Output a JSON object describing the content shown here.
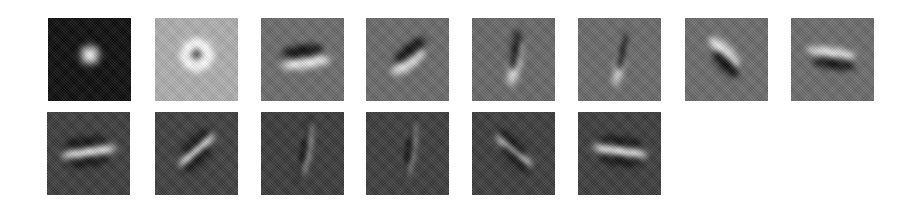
{
  "figure": {
    "rows": 2,
    "tile_size_px": 83,
    "tiles": [
      {
        "row": 0,
        "col": 0,
        "x": 48,
        "y": 18,
        "bg": "#0c0c0c",
        "kind": "center-on",
        "angle": 0,
        "blobs": [
          {
            "dx": 0,
            "dy": -2,
            "w": 14,
            "h": 14,
            "c": "#f2f2f2"
          },
          {
            "dx": 0,
            "dy": -2,
            "w": 22,
            "h": 22,
            "c": "#6a6a6a"
          }
        ]
      },
      {
        "row": 0,
        "col": 1,
        "x": 155,
        "y": 18,
        "bg": "#b0b0b0",
        "kind": "center-off",
        "angle": 0,
        "blobs": [
          {
            "dx": 0,
            "dy": -2,
            "w": 34,
            "h": 34,
            "c": "#ffffff"
          },
          {
            "dx": 0,
            "dy": -2,
            "w": 9,
            "h": 9,
            "c": "#050505"
          }
        ]
      },
      {
        "row": 0,
        "col": 2,
        "x": 261,
        "y": 18,
        "bg": "#6c6c6c",
        "kind": "oriented",
        "angle": 8,
        "blobs": [
          {
            "dx": 0,
            "dy": -6,
            "w": 42,
            "h": 12,
            "c": "#0a0a0a"
          },
          {
            "dx": 2,
            "dy": 6,
            "w": 50,
            "h": 12,
            "c": "#f0f0f0"
          }
        ]
      },
      {
        "row": 0,
        "col": 3,
        "x": 366,
        "y": 18,
        "bg": "#6a6a6a",
        "kind": "oriented",
        "angle": 38,
        "blobs": [
          {
            "dx": 5,
            "dy": -4,
            "w": 40,
            "h": 12,
            "c": "#0a0a0a"
          },
          {
            "dx": -3,
            "dy": 4,
            "w": 40,
            "h": 14,
            "c": "#f0f0f0"
          }
        ]
      },
      {
        "row": 0,
        "col": 4,
        "x": 472,
        "y": 18,
        "bg": "#686868",
        "kind": "oriented",
        "angle": 80,
        "blobs": [
          {
            "dx": -6,
            "dy": 2,
            "w": 48,
            "h": 12,
            "c": "#ececec"
          },
          {
            "dx": 6,
            "dy": 0,
            "w": 42,
            "h": 10,
            "c": "#0a0a0a"
          }
        ]
      },
      {
        "row": 0,
        "col": 5,
        "x": 578,
        "y": 18,
        "bg": "#6a6a6a",
        "kind": "oriented",
        "angle": 78,
        "blobs": [
          {
            "dx": -3,
            "dy": 2,
            "w": 56,
            "h": 9,
            "c": "#f0f0f0"
          },
          {
            "dx": 6,
            "dy": 2,
            "w": 42,
            "h": 9,
            "c": "#0a0a0a"
          }
        ]
      },
      {
        "row": 0,
        "col": 6,
        "x": 685,
        "y": 18,
        "bg": "#6c6c6c",
        "kind": "oriented",
        "angle": -45,
        "blobs": [
          {
            "dx": -5,
            "dy": -2,
            "w": 40,
            "h": 14,
            "c": "#f0f0f0"
          },
          {
            "dx": 4,
            "dy": 6,
            "w": 36,
            "h": 12,
            "c": "#0a0a0a"
          }
        ]
      },
      {
        "row": 0,
        "col": 7,
        "x": 791,
        "y": 18,
        "bg": "#6c6c6c",
        "kind": "oriented",
        "angle": -8,
        "blobs": [
          {
            "dx": -2,
            "dy": -4,
            "w": 50,
            "h": 10,
            "c": "#f0f0f0"
          },
          {
            "dx": 2,
            "dy": 7,
            "w": 44,
            "h": 10,
            "c": "#0a0a0a"
          }
        ]
      },
      {
        "row": 1,
        "col": 0,
        "x": 47,
        "y": 112,
        "bg": "#3c3c3c",
        "kind": "oriented",
        "angle": 8,
        "blobs": [
          {
            "dx": -3,
            "dy": -9,
            "w": 44,
            "h": 9,
            "c": "#0a0a0a"
          },
          {
            "dx": 0,
            "dy": 1,
            "w": 56,
            "h": 10,
            "c": "#f2f2f2"
          },
          {
            "dx": -2,
            "dy": 11,
            "w": 44,
            "h": 8,
            "c": "#0a0a0a"
          }
        ]
      },
      {
        "row": 1,
        "col": 1,
        "x": 155,
        "y": 112,
        "bg": "#3e3e3e",
        "kind": "oriented",
        "angle": 42,
        "blobs": [
          {
            "dx": 4,
            "dy": -8,
            "w": 40,
            "h": 9,
            "c": "#0a0a0a"
          },
          {
            "dx": 0,
            "dy": 0,
            "w": 46,
            "h": 11,
            "c": "#f0f0f0"
          },
          {
            "dx": -5,
            "dy": 8,
            "w": 40,
            "h": 9,
            "c": "#0a0a0a"
          }
        ]
      },
      {
        "row": 1,
        "col": 2,
        "x": 261,
        "y": 112,
        "bg": "#3a3a3a",
        "kind": "oriented",
        "angle": 80,
        "blobs": [
          {
            "dx": -10,
            "dy": 0,
            "w": 44,
            "h": 8,
            "c": "#080808"
          },
          {
            "dx": 0,
            "dy": 2,
            "w": 54,
            "h": 10,
            "c": "#f0f0f0"
          },
          {
            "dx": 10,
            "dy": 0,
            "w": 44,
            "h": 8,
            "c": "#080808"
          }
        ]
      },
      {
        "row": 1,
        "col": 3,
        "x": 366,
        "y": 112,
        "bg": "#3c3c3c",
        "kind": "oriented",
        "angle": 82,
        "blobs": [
          {
            "dx": -9,
            "dy": 0,
            "w": 44,
            "h": 8,
            "c": "#080808"
          },
          {
            "dx": 0,
            "dy": 2,
            "w": 56,
            "h": 9,
            "c": "#f0f0f0"
          },
          {
            "dx": 9,
            "dy": 0,
            "w": 44,
            "h": 8,
            "c": "#080808"
          }
        ]
      },
      {
        "row": 1,
        "col": 4,
        "x": 472,
        "y": 112,
        "bg": "#3c3c3c",
        "kind": "oriented",
        "angle": -42,
        "blobs": [
          {
            "dx": -6,
            "dy": -6,
            "w": 40,
            "h": 9,
            "c": "#080808"
          },
          {
            "dx": 0,
            "dy": 0,
            "w": 46,
            "h": 11,
            "c": "#f0f0f0"
          },
          {
            "dx": 6,
            "dy": 6,
            "w": 40,
            "h": 9,
            "c": "#080808"
          }
        ]
      },
      {
        "row": 1,
        "col": 5,
        "x": 578,
        "y": 112,
        "bg": "#3c3c3c",
        "kind": "oriented",
        "angle": -8,
        "blobs": [
          {
            "dx": 0,
            "dy": -10,
            "w": 44,
            "h": 8,
            "c": "#080808"
          },
          {
            "dx": 0,
            "dy": 0,
            "w": 56,
            "h": 10,
            "c": "#f2f2f2"
          },
          {
            "dx": 2,
            "dy": 10,
            "w": 44,
            "h": 8,
            "c": "#080808"
          }
        ]
      }
    ]
  }
}
